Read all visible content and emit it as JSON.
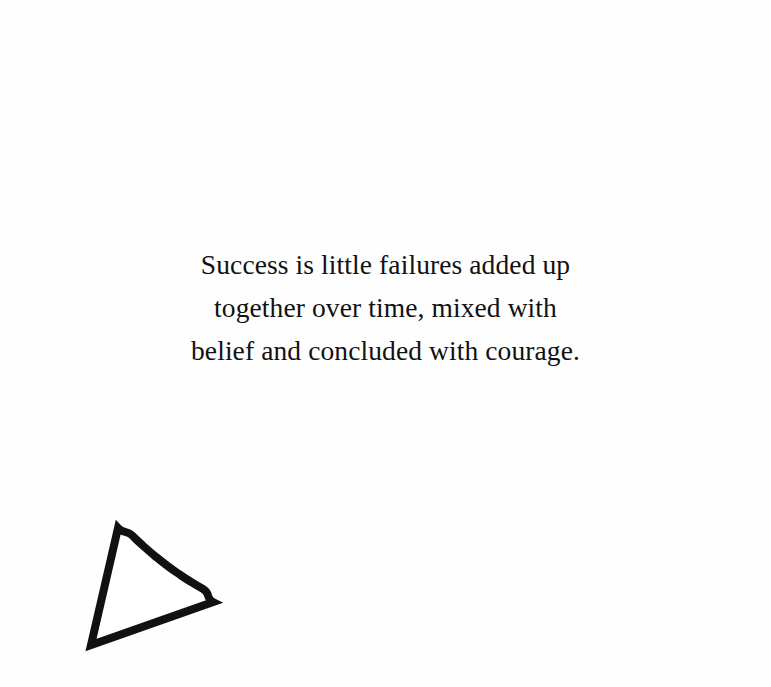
{
  "canvas": {
    "width": 771,
    "height": 687,
    "background_color": "#fefefe"
  },
  "speech_bubble": {
    "shape": "ellipse-with-pointer-tail",
    "outline_color": "#111111",
    "fill_color": "#ffffff",
    "stroke_width_px": 8,
    "ellipse": {
      "center_x": 385,
      "center_y": 339,
      "radius_x": 337,
      "radius_y": 297
    },
    "tail": {
      "notch_point": [
        118,
        528
      ],
      "tip_point": [
        91,
        645
      ],
      "rejoin_point": [
        213,
        602
      ],
      "direction": "lower-left"
    }
  },
  "quote": {
    "full_text": "Success is little failures added up together over time, mixed with belief and concluded with courage.",
    "alignment": "center",
    "text_color": "#111111",
    "lines": [
      "Success is little failures added up",
      "together over time, mixed with",
      "belief and concluded with courage."
    ]
  }
}
